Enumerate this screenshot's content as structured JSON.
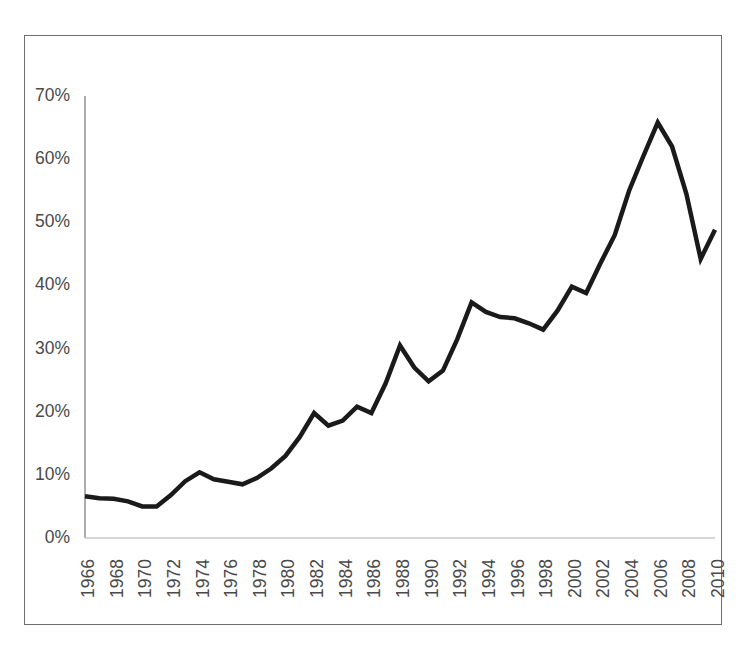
{
  "chart_data": {
    "type": "line",
    "title": "",
    "subtitle": "",
    "xlabel": "",
    "ylabel": "",
    "legend": [],
    "legend_position": "none",
    "grid": false,
    "xlim": [
      1966,
      2010
    ],
    "ylim": [
      0,
      70
    ],
    "y_tick_labels": [
      "0%",
      "10%",
      "20%",
      "30%",
      "40%",
      "50%",
      "60%",
      "70%"
    ],
    "y_tick_values": [
      0,
      10,
      20,
      30,
      40,
      50,
      60,
      70
    ],
    "x_tick_labels": [
      "1966",
      "1968",
      "1970",
      "1972",
      "1974",
      "1976",
      "1978",
      "1980",
      "1982",
      "1984",
      "1986",
      "1988",
      "1990",
      "1992",
      "1994",
      "1996",
      "1998",
      "2000",
      "2002",
      "2004",
      "2006",
      "2008",
      "2010"
    ],
    "x_tick_values": [
      1966,
      1968,
      1970,
      1972,
      1974,
      1976,
      1978,
      1980,
      1982,
      1984,
      1986,
      1988,
      1990,
      1992,
      1994,
      1996,
      1998,
      2000,
      2002,
      2004,
      2006,
      2008,
      2010
    ],
    "units": "percent",
    "line_color": "#1a1a1a",
    "line_width": 4.5,
    "x": [
      1966,
      1967,
      1968,
      1969,
      1970,
      1971,
      1972,
      1973,
      1974,
      1975,
      1976,
      1977,
      1978,
      1979,
      1980,
      1981,
      1982,
      1983,
      1984,
      1985,
      1986,
      1987,
      1988,
      1989,
      1990,
      1991,
      1992,
      1993,
      1994,
      1995,
      1996,
      1997,
      1998,
      1999,
      2000,
      2001,
      2002,
      2003,
      2004,
      2005,
      2006,
      2007,
      2008,
      2009,
      2010
    ],
    "values": [
      6.6,
      6.3,
      6.2,
      5.8,
      5.0,
      5.0,
      6.8,
      9.0,
      10.4,
      9.3,
      8.9,
      8.5,
      9.5,
      11.0,
      13.0,
      16.0,
      19.8,
      17.8,
      18.6,
      20.8,
      19.8,
      24.5,
      30.5,
      27.0,
      24.8,
      26.5,
      31.5,
      37.3,
      35.8,
      35.0,
      34.8,
      34.0,
      33.0,
      36.0,
      39.8,
      38.8,
      43.5,
      48.0,
      55.0,
      60.5,
      65.8,
      62.0,
      54.5,
      44.2,
      48.8
    ]
  },
  "figure": {
    "border_color": "#6e6e6e",
    "background": "#ffffff",
    "axis_color": "#7f7f7f"
  }
}
